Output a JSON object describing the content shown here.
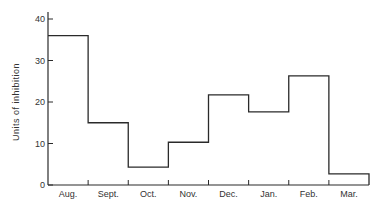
{
  "chart_data": {
    "type": "bar",
    "style": "step-histogram",
    "title": "",
    "xlabel": "",
    "ylabel": "Units of inhibition",
    "categories": [
      "Aug.",
      "Sept.",
      "Oct.",
      "Nov.",
      "Dec.",
      "Jan.",
      "Feb.",
      "Mar."
    ],
    "values": [
      36,
      15,
      4.3,
      10.3,
      21.7,
      17.6,
      26.3,
      2.7
    ],
    "ylim": [
      0,
      40
    ],
    "yticks": [
      0,
      10,
      20,
      30,
      40
    ],
    "grid": false,
    "legend": null
  },
  "axis": {
    "ylabel": "Units of inhibition",
    "yticks": [
      "0",
      "10",
      "20",
      "30",
      "40"
    ],
    "xticks": [
      "Aug.",
      "Sept.",
      "Oct.",
      "Nov.",
      "Dec.",
      "Jan.",
      "Feb.",
      "Mar."
    ]
  },
  "colors": {
    "line": "#2a2a2a",
    "text": "#333333",
    "background": "#ffffff"
  }
}
